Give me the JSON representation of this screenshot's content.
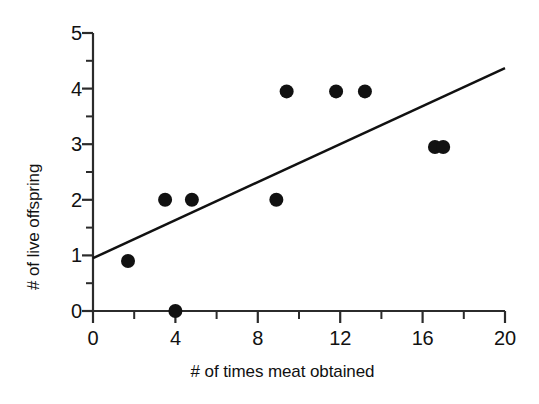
{
  "chart_data": {
    "type": "scatter",
    "title": "",
    "xlabel": "# of times meat obtained",
    "ylabel": "# of live offspring",
    "xlim": [
      0,
      20
    ],
    "ylim": [
      0,
      5
    ],
    "grid": false,
    "legend": null,
    "x_major_ticks": [
      0,
      4,
      8,
      12,
      16,
      20
    ],
    "x_minor_ticks": [
      2,
      6,
      10,
      14,
      18
    ],
    "y_major_ticks": [
      0,
      1,
      2,
      3,
      4,
      5
    ],
    "y_minor_ticks": [
      0.5,
      1.5,
      2.5,
      3.5,
      4.5
    ],
    "x_tick_labels": [
      "0",
      "4",
      "8",
      "12",
      "16",
      "20"
    ],
    "y_tick_labels": [
      "0",
      "1",
      "2",
      "3",
      "4",
      "5"
    ],
    "marker": "filled-circle",
    "marker_color": "#111111",
    "marker_radius": 7,
    "points": [
      {
        "x": 1.7,
        "y": 0.9
      },
      {
        "x": 4.0,
        "y": 0.0
      },
      {
        "x": 3.5,
        "y": 2.0
      },
      {
        "x": 4.8,
        "y": 2.0
      },
      {
        "x": 8.9,
        "y": 2.0
      },
      {
        "x": 9.4,
        "y": 3.95
      },
      {
        "x": 11.8,
        "y": 3.95
      },
      {
        "x": 13.2,
        "y": 3.95
      },
      {
        "x": 16.6,
        "y": 2.95
      },
      {
        "x": 17.0,
        "y": 2.95
      }
    ],
    "trendline": {
      "type": "line",
      "color": "#111111",
      "width": 2.5,
      "x_start": 0,
      "y_start": 0.95,
      "x_end": 20,
      "y_end": 4.37
    }
  },
  "axes": {
    "x_title": "# of times meat obtained",
    "y_title": "# of live offspring"
  }
}
